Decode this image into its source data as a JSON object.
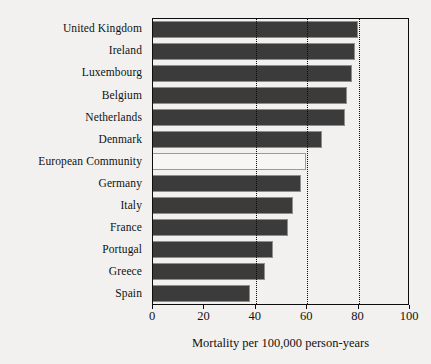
{
  "chart_data": {
    "type": "bar",
    "orientation": "horizontal",
    "title": "",
    "xlabel": "Mortality per 100,000 person-years",
    "ylabel": "",
    "xlim": [
      0,
      100
    ],
    "xticks": [
      0,
      20,
      40,
      60,
      80,
      100
    ],
    "xtick_labels": [
      "0",
      "20",
      "40",
      "60",
      "80",
      "100"
    ],
    "grid": "dotted vertical reference lines at 40, 60, 80",
    "gridlines": [
      40,
      60,
      80
    ],
    "legend": "none",
    "categories": [
      "United Kingdom",
      "Ireland",
      "Luxembourg",
      "Belgium",
      "Netherlands",
      "Denmark",
      "European Community",
      "Germany",
      "Italy",
      "France",
      "Portugal",
      "Greece",
      "Spain"
    ],
    "values": [
      80,
      79,
      78,
      76,
      75,
      66,
      60,
      58,
      55,
      53,
      47,
      44,
      38
    ],
    "highlighted_category": "European Community",
    "bar_fill_color": "#3b3b3b",
    "bar_highlight_fill_color": "#f7f6f4",
    "bar_edge_color": "#8e8e8e",
    "axis_color": "#0d0d0d",
    "background_color": "#f2f1ef"
  }
}
